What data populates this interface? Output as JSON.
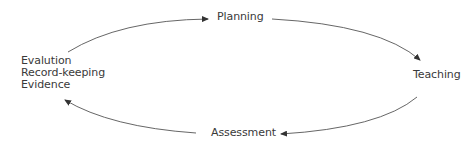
{
  "diagram": {
    "type": "cycle",
    "nodes": {
      "planning": "Planning",
      "teaching": "Teaching",
      "assessment": "Assessment",
      "evaluation": [
        "Evalution",
        "Record-keeping",
        "Evidence"
      ]
    },
    "edges": [
      {
        "from": "evaluation",
        "to": "planning"
      },
      {
        "from": "planning",
        "to": "teaching"
      },
      {
        "from": "teaching",
        "to": "assessment"
      },
      {
        "from": "assessment",
        "to": "evaluation"
      }
    ],
    "colors": {
      "text": "#3a3a3a",
      "arrow": "#444444",
      "background": "#ffffff"
    }
  }
}
